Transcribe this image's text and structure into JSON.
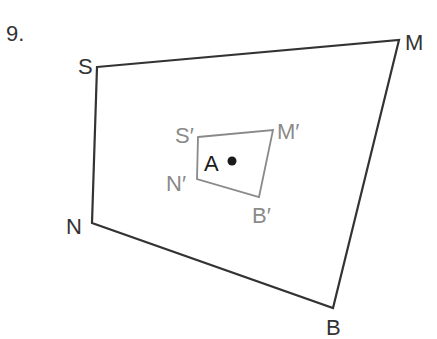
{
  "problem": {
    "number": "9."
  },
  "colors": {
    "original": "#333333",
    "image": "#8a8a8a",
    "center": "#1a1a1a"
  },
  "original_figure": {
    "vertices": [
      {
        "label": "S",
        "x": 97,
        "y": 67
      },
      {
        "label": "M",
        "x": 399,
        "y": 40
      },
      {
        "label": "B",
        "x": 333,
        "y": 308
      },
      {
        "label": "N",
        "x": 92,
        "y": 223
      }
    ]
  },
  "image_figure": {
    "vertices": [
      {
        "label": "S′",
        "x": 198,
        "y": 137
      },
      {
        "label": "M′",
        "x": 273,
        "y": 130
      },
      {
        "label": "B′",
        "x": 259,
        "y": 197
      },
      {
        "label": "N′",
        "x": 197,
        "y": 179
      }
    ]
  },
  "center": {
    "label": "A",
    "x": 232,
    "y": 161
  }
}
